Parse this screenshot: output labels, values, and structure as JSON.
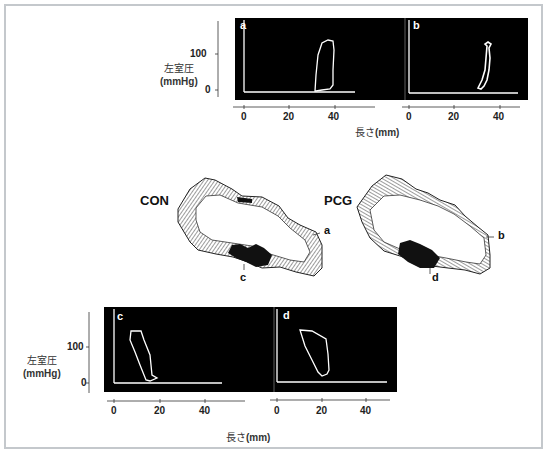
{
  "figure": {
    "top_row": {
      "y_axis_label": "左室圧",
      "y_axis_unit": "(mmHg)",
      "y_ticks": [
        "100",
        "0"
      ],
      "x_axis_label": "長さ",
      "x_axis_unit": "(mm)",
      "panels": [
        {
          "letter": "a",
          "x_ticks": [
            "0",
            "20",
            "40"
          ]
        },
        {
          "letter": "b",
          "x_ticks": [
            "0",
            "20",
            "40"
          ]
        }
      ]
    },
    "middle_row": {
      "shapes": [
        {
          "tag": "CON",
          "markers": [
            "a",
            "c"
          ]
        },
        {
          "tag": "PCG",
          "markers": [
            "b",
            "d"
          ]
        }
      ]
    },
    "bottom_row": {
      "y_axis_label": "左室圧",
      "y_axis_unit": "(mmHg)",
      "y_ticks": [
        "100",
        "0"
      ],
      "x_axis_label": "長さ",
      "x_axis_unit": "(mm)",
      "panels": [
        {
          "letter": "c",
          "x_ticks": [
            "0",
            "20",
            "40"
          ]
        },
        {
          "letter": "d",
          "x_ticks": [
            "0",
            "20",
            "40"
          ]
        }
      ]
    },
    "colors": {
      "frame_border": "#c4c8cc",
      "panel_bg": "#000000",
      "trace": "#ffffff",
      "ink": "#111111"
    }
  }
}
